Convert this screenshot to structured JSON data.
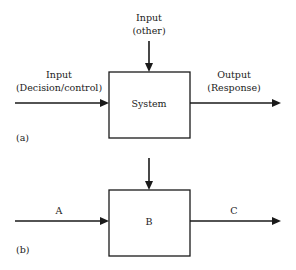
{
  "diagram_a": {
    "panel_label": "(a)",
    "block_label": "System",
    "input_left": [
      "Input",
      "(Decision/control)"
    ],
    "input_top": [
      "Input",
      "(other)"
    ],
    "output_right": [
      "Output",
      "(Response)"
    ]
  },
  "diagram_b": {
    "panel_label": "(b)",
    "block_label": "B",
    "input_left": "A",
    "output_right": "C"
  }
}
